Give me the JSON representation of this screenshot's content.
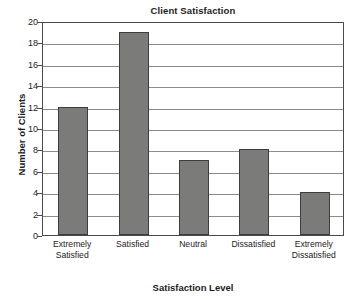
{
  "chart_data": {
    "type": "bar",
    "title": "Client Satisfaction",
    "xlabel": "Satisfaction Level",
    "ylabel": "Number of Clients",
    "categories": [
      "Extremely Satisfied",
      "Satisfied",
      "Neutral",
      "Dissatisfied",
      "Extremely Dissatisfied"
    ],
    "category_lines": [
      [
        "Extremely",
        "Satisfied"
      ],
      [
        "Satisfied",
        ""
      ],
      [
        "Neutral",
        ""
      ],
      [
        "Dissatisfied",
        ""
      ],
      [
        "Extremely",
        "Dissatisfied"
      ]
    ],
    "values": [
      12,
      19,
      7,
      8,
      4
    ],
    "ylim": [
      0,
      20
    ],
    "ytick_step": 2,
    "yticks": [
      0,
      2,
      4,
      6,
      8,
      10,
      12,
      14,
      16,
      18,
      20
    ],
    "ytick_labels": [
      "0",
      "2",
      "4",
      "6",
      "8",
      "10",
      "12",
      "14",
      "16",
      "18",
      "20"
    ],
    "grid": true,
    "grid_axis": "y",
    "legend": false,
    "bar_color": "#7b7b79",
    "bar_edge_color": "#3d3d3d",
    "grid_color": "#8b8b8b",
    "frame_color": "#4a4a4a",
    "text_color": "#1c1c1c",
    "background": "#ffffff"
  }
}
